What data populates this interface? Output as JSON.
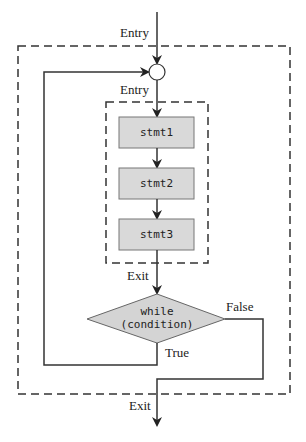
{
  "diagram": {
    "type": "flowchart",
    "colors": {
      "line": "#333333",
      "box_fill": "#d9d9d9",
      "box_stroke": "#777777",
      "diamond_fill": "#d4d4d4",
      "dash": "#333333"
    },
    "labels": {
      "entry_outer": "Entry",
      "entry_inner": "Entry",
      "exit_inner": "Exit",
      "exit_outer": "Exit",
      "true_label": "True",
      "false_label": "False"
    },
    "statements": [
      {
        "id": "stmt1",
        "label": "stmt1"
      },
      {
        "id": "stmt2",
        "label": "stmt2"
      },
      {
        "id": "stmt3",
        "label": "stmt3"
      }
    ],
    "condition": {
      "line1": "while",
      "line2": "(condition)"
    },
    "junction": "merge-circle"
  }
}
